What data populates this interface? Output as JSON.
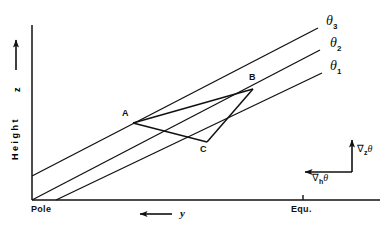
{
  "figure": {
    "background_color": "#ffffff",
    "line_color": "#1a1a1a"
  },
  "axes": {
    "vertical": {
      "caption": "Height",
      "symbol": "z",
      "arrow_direction": "up",
      "origin_px": [
        32,
        200
      ],
      "top_px": [
        32,
        25
      ]
    },
    "horizontal": {
      "left_label": "Pole",
      "right_label": "Equ.",
      "symbol": "y",
      "arrow_direction": "left",
      "origin_px": [
        32,
        200
      ],
      "right_px": [
        380,
        200
      ],
      "tick_px": 303
    }
  },
  "isentropes": [
    {
      "name": "theta-1",
      "label": "θ",
      "subscript": "1",
      "label_px": [
        330,
        66
      ],
      "start_px": [
        56,
        200
      ],
      "end_px": [
        322,
        73
      ]
    },
    {
      "name": "theta-2",
      "label": "θ",
      "subscript": "2",
      "label_px": [
        330,
        43
      ],
      "start_px": [
        32,
        200
      ],
      "end_px": [
        320,
        50
      ]
    },
    {
      "name": "theta-3",
      "label": "θ",
      "subscript": "3",
      "label_px": [
        326,
        21
      ],
      "start_px": [
        32,
        176
      ],
      "end_px": [
        318,
        28
      ]
    }
  ],
  "parcel_path": {
    "points": [
      {
        "id": "A",
        "label": "A",
        "x": 133,
        "y": 123,
        "label_px": [
          123,
          112
        ]
      },
      {
        "id": "B",
        "label": "B",
        "x": 253,
        "y": 89,
        "label_px": [
          250,
          76
        ]
      },
      {
        "id": "C",
        "label": "C",
        "x": 207,
        "y": 142,
        "label_px": [
          201,
          149
        ]
      }
    ],
    "segments": [
      {
        "from": "A",
        "to": "B"
      },
      {
        "from": "B",
        "to": "C"
      },
      {
        "from": "C",
        "to": "A"
      }
    ]
  },
  "gradient_key": {
    "corner_px": [
      352,
      172
    ],
    "vertical": {
      "symbol": "∇",
      "subscript": "z",
      "variable": "θ",
      "label_px": [
        358,
        148
      ],
      "arrow_tip_px": [
        352,
        138
      ]
    },
    "horizontal": {
      "symbol": "∇",
      "subscript": "h",
      "variable": "θ",
      "label_px": [
        314,
        176
      ],
      "arrow_tip_px": [
        303,
        172
      ]
    }
  }
}
